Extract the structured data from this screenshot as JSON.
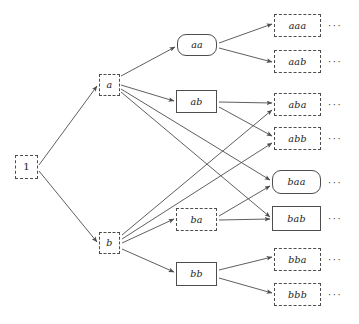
{
  "figure": {
    "type": "diagram",
    "background_color": "#ffffff",
    "line_color": "#4d4d4d",
    "text_color": "#1a1a1a"
  },
  "legend": {
    "dashed_style": "dashed rectangle",
    "solid_style": "solid rectangle",
    "rounded_style": "solid rounded rectangle"
  },
  "nodes": [
    {
      "id": "root",
      "label": "1",
      "style": "dashed",
      "shape": "rect",
      "x": 15,
      "y": 155,
      "w": 23,
      "h": 24,
      "level": 0
    },
    {
      "id": "a",
      "label": "a",
      "style": "dashed",
      "shape": "rect",
      "x": 99,
      "y": 74,
      "w": 21,
      "h": 22,
      "level": 1
    },
    {
      "id": "b",
      "label": "b",
      "style": "dashed",
      "shape": "rect",
      "x": 99,
      "y": 232,
      "w": 21,
      "h": 22,
      "level": 1
    },
    {
      "id": "aa",
      "label": "aa",
      "style": "solid",
      "shape": "rounded-rect",
      "x": 177,
      "y": 34,
      "w": 40,
      "h": 22,
      "level": 2
    },
    {
      "id": "ab",
      "label": "ab",
      "style": "solid",
      "shape": "rect",
      "x": 176,
      "y": 90,
      "w": 41,
      "h": 23,
      "level": 2
    },
    {
      "id": "ba",
      "label": "ba",
      "style": "dashed",
      "shape": "rect",
      "x": 176,
      "y": 208,
      "w": 41,
      "h": 23,
      "level": 2
    },
    {
      "id": "bb",
      "label": "bb",
      "style": "solid",
      "shape": "rect",
      "x": 176,
      "y": 262,
      "w": 41,
      "h": 24,
      "level": 2
    },
    {
      "id": "aaa",
      "label": "aaa",
      "style": "dashed",
      "shape": "rect",
      "x": 274,
      "y": 14,
      "w": 47,
      "h": 23,
      "level": 3
    },
    {
      "id": "aab",
      "label": "aab",
      "style": "dashed",
      "shape": "rect",
      "x": 274,
      "y": 50,
      "w": 47,
      "h": 23,
      "level": 3
    },
    {
      "id": "aba",
      "label": "aba",
      "style": "dashed",
      "shape": "rect",
      "x": 274,
      "y": 93,
      "w": 47,
      "h": 23,
      "level": 3
    },
    {
      "id": "abb",
      "label": "abb",
      "style": "dashed",
      "shape": "rect",
      "x": 274,
      "y": 127,
      "w": 47,
      "h": 23,
      "level": 3
    },
    {
      "id": "baa",
      "label": "baa",
      "style": "solid",
      "shape": "rounded-rect",
      "x": 272,
      "y": 170,
      "w": 49,
      "h": 24,
      "level": 3
    },
    {
      "id": "bab",
      "label": "bab",
      "style": "solid",
      "shape": "rect",
      "x": 272,
      "y": 206,
      "w": 49,
      "h": 25,
      "level": 3
    },
    {
      "id": "bba",
      "label": "bba",
      "style": "dashed",
      "shape": "rect",
      "x": 274,
      "y": 248,
      "w": 47,
      "h": 23,
      "level": 3
    },
    {
      "id": "bbb",
      "label": "bbb",
      "style": "dashed",
      "shape": "rect",
      "x": 274,
      "y": 283,
      "w": 47,
      "h": 23,
      "level": 3
    }
  ],
  "edges": [
    {
      "from": "root",
      "to": "a",
      "x1": 39,
      "y1": 165,
      "x2": 97,
      "y2": 86
    },
    {
      "from": "root",
      "to": "b",
      "x1": 39,
      "y1": 171,
      "x2": 97,
      "y2": 242
    },
    {
      "from": "a",
      "to": "aa",
      "x1": 121,
      "y1": 76,
      "x2": 175,
      "y2": 47
    },
    {
      "from": "a",
      "to": "ab",
      "x1": 121,
      "y1": 85,
      "x2": 174,
      "y2": 101
    },
    {
      "from": "a",
      "to": "baa",
      "x1": 121,
      "y1": 89,
      "x2": 270,
      "y2": 180
    },
    {
      "from": "a",
      "to": "bab",
      "x1": 121,
      "y1": 92,
      "x2": 270,
      "y2": 217
    },
    {
      "from": "aa",
      "to": "aaa",
      "x1": 219,
      "y1": 43,
      "x2": 272,
      "y2": 24
    },
    {
      "from": "aa",
      "to": "aab",
      "x1": 219,
      "y1": 48,
      "x2": 272,
      "y2": 62
    },
    {
      "from": "ab",
      "to": "aba",
      "x1": 219,
      "y1": 102,
      "x2": 272,
      "y2": 103
    },
    {
      "from": "ab",
      "to": "abb",
      "x1": 219,
      "y1": 107,
      "x2": 272,
      "y2": 136
    },
    {
      "from": "b",
      "to": "aba",
      "x1": 122,
      "y1": 235,
      "x2": 272,
      "y2": 110
    },
    {
      "from": "b",
      "to": "abb",
      "x1": 122,
      "y1": 239,
      "x2": 272,
      "y2": 143
    },
    {
      "from": "b",
      "to": "ba",
      "x1": 122,
      "y1": 243,
      "x2": 174,
      "y2": 219
    },
    {
      "from": "b",
      "to": "bb",
      "x1": 122,
      "y1": 249,
      "x2": 174,
      "y2": 272
    },
    {
      "from": "ba",
      "to": "baa",
      "x1": 219,
      "y1": 216,
      "x2": 270,
      "y2": 186
    },
    {
      "from": "ba",
      "to": "bab",
      "x1": 219,
      "y1": 220,
      "x2": 270,
      "y2": 219
    },
    {
      "from": "bb",
      "to": "bba",
      "x1": 219,
      "y1": 270,
      "x2": 272,
      "y2": 257
    },
    {
      "from": "bb",
      "to": "bbb",
      "x1": 219,
      "y1": 278,
      "x2": 272,
      "y2": 293
    }
  ],
  "continuations": [
    {
      "for": "aaa",
      "label": "···",
      "x": 328,
      "y": 21
    },
    {
      "for": "aab",
      "label": "···",
      "x": 328,
      "y": 57
    },
    {
      "for": "aba",
      "label": "···",
      "x": 328,
      "y": 100
    },
    {
      "for": "abb",
      "label": "···",
      "x": 328,
      "y": 134
    },
    {
      "for": "baa",
      "label": "···",
      "x": 328,
      "y": 178
    },
    {
      "for": "bab",
      "label": "···",
      "x": 328,
      "y": 214
    },
    {
      "for": "bba",
      "label": "···",
      "x": 328,
      "y": 255
    },
    {
      "for": "bbb",
      "label": "···",
      "x": 328,
      "y": 290
    }
  ]
}
